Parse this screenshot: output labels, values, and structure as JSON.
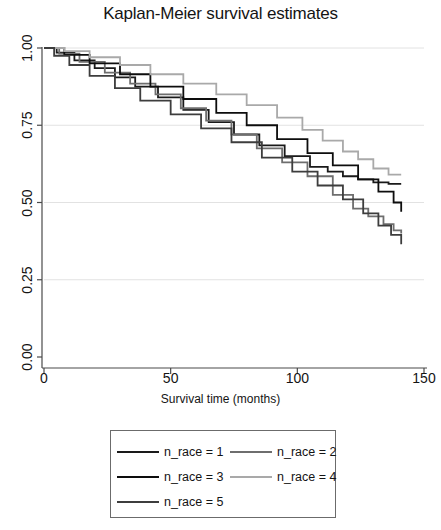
{
  "chart_data": {
    "type": "line",
    "title": "Kaplan-Meier survival estimates",
    "xlabel": "Survival time (months)",
    "ylabel": "",
    "xlim": [
      0,
      150
    ],
    "ylim": [
      0,
      1.0
    ],
    "xticks": [
      0,
      50,
      100,
      150
    ],
    "xtick_labels": [
      "0",
      "50",
      "100",
      "150"
    ],
    "yticks": [
      0.0,
      0.25,
      0.5,
      0.75,
      1.0
    ],
    "ytick_labels": [
      "0.00",
      "0.25",
      "0.50",
      "0.75",
      "1.00"
    ],
    "grid": "horizontal",
    "legend_position": "below-plot",
    "series": [
      {
        "name": "n_race = 1",
        "color": "#1a1a1a",
        "x": [
          0,
          5,
          12,
          20,
          28,
          36,
          45,
          55,
          65,
          75,
          85,
          95,
          105,
          112,
          118,
          124,
          130,
          136,
          141
        ],
        "y": [
          1.0,
          0.985,
          0.96,
          0.935,
          0.905,
          0.875,
          0.84,
          0.8,
          0.76,
          0.72,
          0.685,
          0.65,
          0.615,
          0.6,
          0.585,
          0.575,
          0.565,
          0.56,
          0.56
        ]
      },
      {
        "name": "n_race = 2",
        "color": "#6e6e6e",
        "x": [
          0,
          6,
          14,
          24,
          34,
          44,
          54,
          64,
          74,
          84,
          94,
          104,
          114,
          122,
          128,
          134,
          138,
          141
        ],
        "y": [
          1.0,
          0.982,
          0.955,
          0.92,
          0.885,
          0.85,
          0.805,
          0.765,
          0.72,
          0.675,
          0.63,
          0.585,
          0.525,
          0.48,
          0.455,
          0.43,
          0.41,
          0.4
        ]
      },
      {
        "name": "n_race = 3",
        "color": "#0d0d0d",
        "x": [
          0,
          8,
          18,
          30,
          42,
          55,
          68,
          80,
          92,
          104,
          114,
          124,
          132,
          138,
          141
        ],
        "y": [
          1.0,
          0.978,
          0.95,
          0.915,
          0.875,
          0.835,
          0.79,
          0.75,
          0.705,
          0.66,
          0.62,
          0.575,
          0.535,
          0.5,
          0.47
        ]
      },
      {
        "name": "n_race = 4",
        "color": "#a9a9a9",
        "x": [
          0,
          8,
          18,
          30,
          42,
          55,
          68,
          80,
          92,
          102,
          110,
          118,
          124,
          130,
          136,
          141
        ],
        "y": [
          1.0,
          0.99,
          0.97,
          0.945,
          0.915,
          0.885,
          0.85,
          0.815,
          0.775,
          0.735,
          0.7,
          0.665,
          0.64,
          0.61,
          0.59,
          0.59
        ]
      },
      {
        "name": "n_race = 5",
        "color": "#3d3d3d",
        "x": [
          0,
          4,
          10,
          18,
          28,
          38,
          50,
          62,
          74,
          86,
          98,
          108,
          118,
          126,
          132,
          137,
          141
        ],
        "y": [
          1.0,
          0.975,
          0.945,
          0.91,
          0.87,
          0.83,
          0.785,
          0.74,
          0.695,
          0.645,
          0.6,
          0.555,
          0.51,
          0.465,
          0.425,
          0.395,
          0.365
        ]
      }
    ]
  },
  "legend": {
    "entries": [
      {
        "label": "n_race = 1",
        "color": "#1a1a1a"
      },
      {
        "label": "n_race = 2",
        "color": "#6e6e6e"
      },
      {
        "label": "n_race = 3",
        "color": "#0d0d0d"
      },
      {
        "label": "n_race = 4",
        "color": "#a9a9a9"
      },
      {
        "label": "n_race = 5",
        "color": "#3d3d3d"
      }
    ]
  },
  "axes": {
    "axis_color": "#4a4a4a",
    "grid_color": "#e2e2e2"
  }
}
